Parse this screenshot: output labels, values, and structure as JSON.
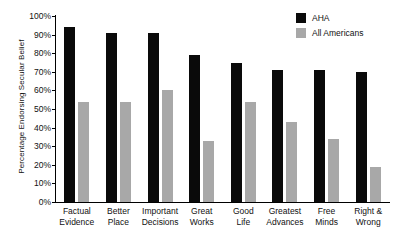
{
  "chart_data": {
    "type": "bar",
    "title": "",
    "xlabel": "",
    "ylabel": "Percentage Endorsing Secular Belief",
    "ylim": [
      0,
      100
    ],
    "ytick_labels": [
      "100%",
      "90%",
      "80%",
      "70%",
      "60%",
      "50%",
      "40%",
      "30%",
      "20%",
      "10%",
      "0%"
    ],
    "ytick_values": [
      100,
      90,
      80,
      70,
      60,
      50,
      40,
      30,
      20,
      10,
      0
    ],
    "grid": false,
    "legend_position": "top-right",
    "categories": [
      "Factual Evidence",
      "Better Place",
      "Important Decisions",
      "Great Works",
      "Good Life",
      "Greatest Advances",
      "Free Minds",
      "Right & Wrong"
    ],
    "category_lines": [
      [
        "Factual",
        "Evidence"
      ],
      [
        "Better",
        "Place"
      ],
      [
        "Important",
        "Decisions"
      ],
      [
        "Great",
        "Works"
      ],
      [
        "Good",
        "Life"
      ],
      [
        "Greatest",
        "Advances"
      ],
      [
        "Free",
        "Minds"
      ],
      [
        "Right &",
        "Wrong"
      ]
    ],
    "series": [
      {
        "name": "AHA",
        "color": "#0a0a0a",
        "values": [
          94,
          91,
          91,
          79,
          75,
          71,
          71,
          70
        ]
      },
      {
        "name": "All Americans",
        "color": "#a8a8a8",
        "values": [
          54,
          54,
          60,
          33,
          54,
          43,
          34,
          19
        ]
      }
    ]
  },
  "legend": {
    "items": [
      {
        "label": "AHA",
        "color": "#0a0a0a"
      },
      {
        "label": "All Americans",
        "color": "#a8a8a8"
      }
    ]
  }
}
